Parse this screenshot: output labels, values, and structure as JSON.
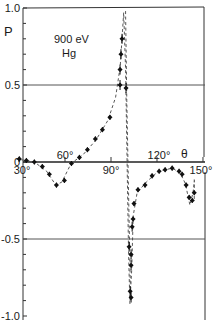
{
  "chart_data": {
    "type": "scatter",
    "title": "900 eV Hg",
    "annotation_lines": [
      "900 eV",
      "Hg"
    ],
    "xlabel": "θ",
    "ylabel": "P",
    "xlim": [
      27,
      152
    ],
    "ylim": [
      -1.0,
      1.0
    ],
    "x_ticks": [
      30,
      60,
      90,
      120,
      150
    ],
    "x_tick_labels": [
      "30°",
      "60°",
      "90°",
      "120°",
      "150°"
    ],
    "y_ticks": [
      1.0,
      0.5,
      0,
      -0.5,
      -1.0
    ],
    "y_tick_labels": [
      "1.0",
      "0.5",
      "0",
      "-0.5",
      "-1.0"
    ],
    "reference_lines": [
      0.5,
      0,
      -0.5
    ],
    "grid": false,
    "series": [
      {
        "name": "measured P (900 eV, Hg)",
        "style": "points-with-error-bars",
        "points": [
          {
            "x": 30.2,
            "y": 0.02
          },
          {
            "x": 34.8,
            "y": 0.01
          },
          {
            "x": 40.0,
            "y": 0.0
          },
          {
            "x": 45.2,
            "y": -0.03
          },
          {
            "x": 49.8,
            "y": -0.08
          },
          {
            "x": 54.4,
            "y": -0.15
          },
          {
            "x": 59.6,
            "y": -0.12
          },
          {
            "x": 64.2,
            "y": -0.01
          },
          {
            "x": 69.4,
            "y": 0.03
          },
          {
            "x": 74.6,
            "y": 0.08
          },
          {
            "x": 79.8,
            "y": 0.15
          },
          {
            "x": 84.4,
            "y": 0.21
          },
          {
            "x": 89.3,
            "y": 0.29
          },
          {
            "x": 95.9,
            "y": 0.5
          },
          {
            "x": 95.9,
            "y": 0.6
          },
          {
            "x": 96.5,
            "y": 0.7
          },
          {
            "x": 97.2,
            "y": 0.8
          },
          {
            "x": 99.8,
            "y": 0.48
          },
          {
            "x": 101.8,
            "y": -0.55
          },
          {
            "x": 103.1,
            "y": -0.6
          },
          {
            "x": 103.1,
            "y": -0.67
          },
          {
            "x": 102.5,
            "y": -0.84
          },
          {
            "x": 103.1,
            "y": -0.88
          },
          {
            "x": 103.8,
            "y": -0.42
          },
          {
            "x": 104.4,
            "y": -0.37
          },
          {
            "x": 105.0,
            "y": -0.27
          },
          {
            "x": 107.6,
            "y": -0.18
          },
          {
            "x": 112.2,
            "y": -0.15
          },
          {
            "x": 116.8,
            "y": -0.09
          },
          {
            "x": 121.4,
            "y": -0.06
          },
          {
            "x": 125.3,
            "y": -0.05
          },
          {
            "x": 129.9,
            "y": -0.04
          },
          {
            "x": 134.4,
            "y": -0.06
          },
          {
            "x": 136.4,
            "y": -0.08
          },
          {
            "x": 139.0,
            "y": -0.15
          },
          {
            "x": 141.0,
            "y": -0.23
          },
          {
            "x": 143.0,
            "y": -0.25
          },
          {
            "x": 144.3,
            "y": -0.2
          }
        ]
      },
      {
        "name": "theory (dashed)",
        "style": "dashed-line",
        "points": [
          {
            "x": 28,
            "y": 0.02
          },
          {
            "x": 40,
            "y": 0.0
          },
          {
            "x": 48,
            "y": -0.06
          },
          {
            "x": 54,
            "y": -0.15
          },
          {
            "x": 58,
            "y": -0.13
          },
          {
            "x": 64,
            "y": -0.01
          },
          {
            "x": 72,
            "y": 0.05
          },
          {
            "x": 80,
            "y": 0.14
          },
          {
            "x": 88,
            "y": 0.27
          },
          {
            "x": 93,
            "y": 0.42
          },
          {
            "x": 96,
            "y": 0.62
          },
          {
            "x": 97.5,
            "y": 0.85
          },
          {
            "x": 98.3,
            "y": 0.97
          },
          {
            "x": 99.5,
            "y": 0.6
          },
          {
            "x": 100.5,
            "y": 0.0
          },
          {
            "x": 101.5,
            "y": -0.6
          },
          {
            "x": 102.3,
            "y": -0.92
          },
          {
            "x": 103.5,
            "y": -0.7
          },
          {
            "x": 104.5,
            "y": -0.35
          },
          {
            "x": 107,
            "y": -0.2
          },
          {
            "x": 113,
            "y": -0.13
          },
          {
            "x": 121,
            "y": -0.06
          },
          {
            "x": 130,
            "y": -0.04
          },
          {
            "x": 135,
            "y": -0.07
          },
          {
            "x": 138.5,
            "y": -0.14
          },
          {
            "x": 141.5,
            "y": -0.28
          },
          {
            "x": 143.5,
            "y": -0.2
          },
          {
            "x": 144.5,
            "y": -0.12
          }
        ]
      }
    ],
    "legend": null
  }
}
